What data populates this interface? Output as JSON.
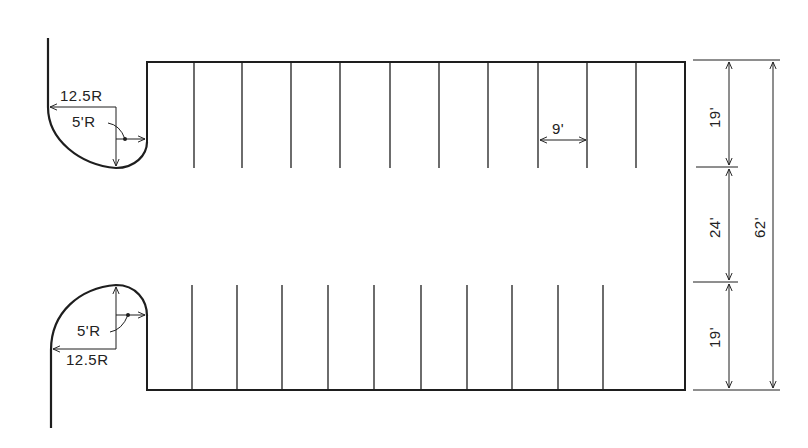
{
  "diagram": {
    "colors": {
      "line": "#1e1e1e",
      "background": "#ffffff"
    },
    "stall_width_label": "9'",
    "top_curb": {
      "outer_radius_label": "12.5R",
      "inner_radius_label": "5'R"
    },
    "bottom_curb": {
      "outer_radius_label": "12.5R",
      "inner_radius_label": "5'R"
    },
    "dimensions": {
      "top_stall_depth": "19'",
      "aisle_width": "24'",
      "bottom_stall_depth": "19'",
      "total_depth": "62'"
    },
    "stall_lines_top_count": 10,
    "stall_lines_bottom_count": 10
  }
}
